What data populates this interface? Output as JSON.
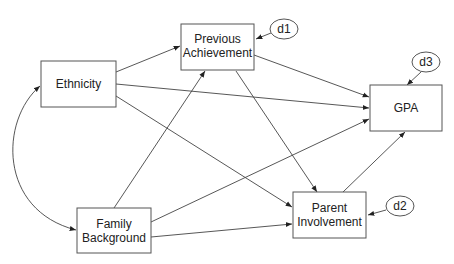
{
  "nodes": {
    "ethnicity": {
      "label": [
        "Ethnicity"
      ]
    },
    "prev_ach": {
      "label": [
        "Previous",
        "Achievement"
      ]
    },
    "gpa": {
      "label": [
        "GPA"
      ]
    },
    "family": {
      "label": [
        "Family",
        "Background"
      ]
    },
    "parent": {
      "label": [
        "Parent",
        "Involvement"
      ]
    },
    "d1": {
      "label": "d1"
    },
    "d2": {
      "label": "d2"
    },
    "d3": {
      "label": "d3"
    }
  },
  "edges": [
    {
      "from": "Ethnicity",
      "to": "Previous Achievement"
    },
    {
      "from": "Ethnicity",
      "to": "GPA"
    },
    {
      "from": "Ethnicity",
      "to": "Parent Involvement"
    },
    {
      "from": "Family Background",
      "to": "Previous Achievement"
    },
    {
      "from": "Family Background",
      "to": "GPA"
    },
    {
      "from": "Family Background",
      "to": "Parent Involvement"
    },
    {
      "from": "Previous Achievement",
      "to": "GPA"
    },
    {
      "from": "Previous Achievement",
      "to": "Parent Involvement"
    },
    {
      "from": "Parent Involvement",
      "to": "GPA"
    },
    {
      "from": "d1",
      "to": "Previous Achievement"
    },
    {
      "from": "d2",
      "to": "Parent Involvement"
    },
    {
      "from": "d3",
      "to": "GPA"
    },
    {
      "from": "Ethnicity",
      "to": "Family Background",
      "type": "covariance"
    }
  ]
}
